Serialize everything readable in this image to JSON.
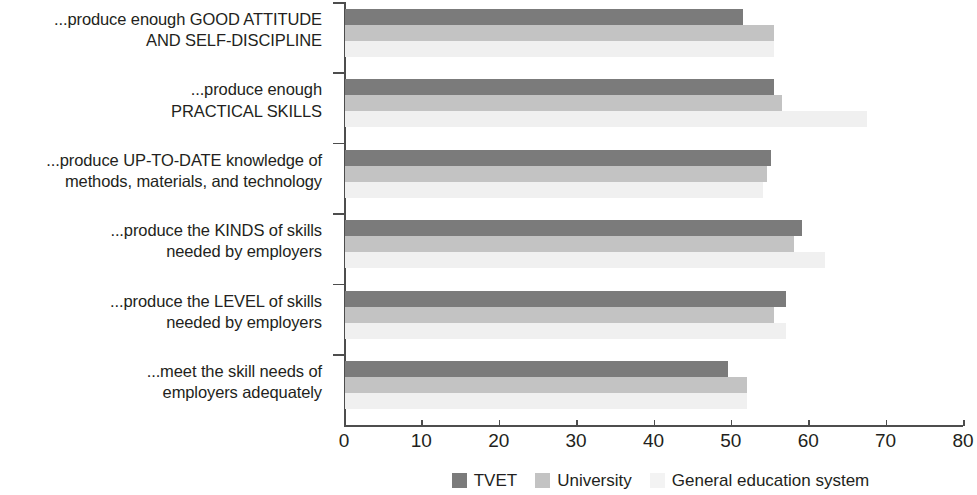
{
  "chart_data": {
    "type": "bar",
    "orientation": "horizontal",
    "title": "",
    "xlabel": "",
    "ylabel": "",
    "xlim": [
      0,
      80
    ],
    "xticks": [
      0,
      10,
      20,
      30,
      40,
      50,
      60,
      70,
      80
    ],
    "grid": false,
    "legend_position": "bottom",
    "categories": [
      "...produce enough GOOD ATTITUDE\nAND SELF-DISCIPLINE",
      "...produce enough\nPRACTICAL SKILLS",
      "...produce UP-TO-DATE knowledge of\nmethods, materials, and technology",
      "...produce the KINDS of skills\nneeded by employers",
      "...produce the LEVEL of skills\nneeded by employers",
      "...meet the skill needs of\nemployers adequately"
    ],
    "category_lines": [
      [
        "...produce enough GOOD ATTITUDE",
        "AND SELF-DISCIPLINE"
      ],
      [
        "...produce enough",
        "PRACTICAL SKILLS"
      ],
      [
        "...produce UP-TO-DATE knowledge of",
        "methods, materials, and technology"
      ],
      [
        "...produce the KINDS of skills",
        "needed by employers"
      ],
      [
        "...produce the LEVEL of skills",
        "needed by employers"
      ],
      [
        "...meet the skill needs of",
        "employers adequately"
      ]
    ],
    "series": [
      {
        "name": "TVET",
        "color": "#7b7b7b",
        "values": [
          51.5,
          55.5,
          55.0,
          59.0,
          57.0,
          49.5
        ]
      },
      {
        "name": "University",
        "color": "#c3c3c3",
        "values": [
          55.5,
          56.5,
          54.5,
          58.0,
          55.5,
          52.0
        ]
      },
      {
        "name": "General education system",
        "color": "#f0f0f0",
        "values": [
          55.5,
          67.5,
          54.0,
          62.0,
          57.0,
          52.0
        ]
      }
    ]
  },
  "legend": {
    "items": [
      {
        "label": "TVET",
        "color": "#7b7b7b"
      },
      {
        "label": "University",
        "color": "#c3c3c3"
      },
      {
        "label": "General education system",
        "color": "#f3f3f3"
      }
    ]
  },
  "axis": {
    "tick_labels": [
      "0",
      "10",
      "20",
      "30",
      "40",
      "50",
      "60",
      "70",
      "80"
    ]
  }
}
